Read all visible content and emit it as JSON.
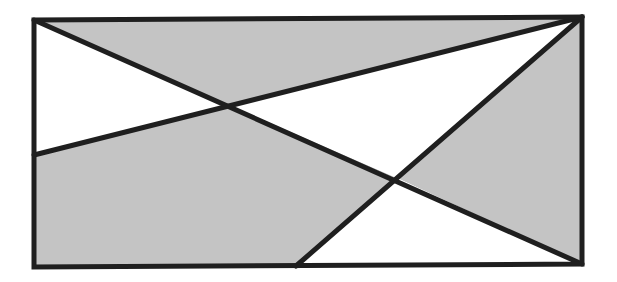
{
  "diagram": {
    "type": "geometric-figure",
    "colors": {
      "shaded": "#c4c4c4",
      "unshaded": "#ffffff",
      "line": "#1f1f1f",
      "background": "#ffffff"
    },
    "rectangle": {
      "corners": {
        "top_left": [
          34,
          20
        ],
        "top_right": [
          582,
          17
        ],
        "bottom_right": [
          582,
          264
        ],
        "bottom_left": [
          34,
          267
        ]
      }
    },
    "segments": [
      {
        "name": "diagonal-top-left-to-bottom-right",
        "from": [
          34,
          20
        ],
        "to": [
          582,
          264
        ]
      },
      {
        "name": "top-right-to-left-edge",
        "from": [
          582,
          17
        ],
        "to": [
          34,
          155
        ]
      },
      {
        "name": "top-right-to-bottom-edge",
        "from": [
          582,
          17
        ],
        "to": [
          296,
          266
        ]
      }
    ],
    "intersections": [
      {
        "name": "left-crossing",
        "point": [
          229,
          105
        ]
      },
      {
        "name": "right-crossing",
        "point": [
          397,
          178
        ]
      }
    ],
    "regions": [
      {
        "name": "top-shaded-triangle",
        "shade": "gray",
        "points": [
          [
            34,
            20
          ],
          [
            582,
            17
          ],
          [
            229,
            105
          ]
        ]
      },
      {
        "name": "left-white-triangle",
        "shade": "white",
        "points": [
          [
            34,
            20
          ],
          [
            229,
            105
          ],
          [
            34,
            155
          ]
        ]
      },
      {
        "name": "left-shaded-pentagon",
        "shade": "gray",
        "points": [
          [
            34,
            155
          ],
          [
            229,
            105
          ],
          [
            397,
            178
          ],
          [
            296,
            266
          ],
          [
            34,
            267
          ]
        ]
      },
      {
        "name": "center-white-triangle",
        "shade": "white",
        "points": [
          [
            229,
            105
          ],
          [
            582,
            17
          ],
          [
            397,
            178
          ]
        ]
      },
      {
        "name": "right-shaded-triangle",
        "shade": "gray",
        "points": [
          [
            582,
            17
          ],
          [
            582,
            264
          ],
          [
            397,
            178
          ]
        ]
      },
      {
        "name": "bottom-white-triangle",
        "shade": "white",
        "points": [
          [
            397,
            178
          ],
          [
            582,
            264
          ],
          [
            296,
            266
          ]
        ]
      }
    ]
  }
}
